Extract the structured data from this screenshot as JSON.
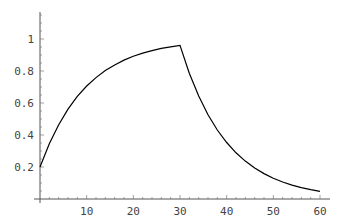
{
  "chart_data": {
    "type": "line",
    "title": "",
    "xlabel": "",
    "ylabel": "",
    "xlim": [
      0,
      61
    ],
    "ylim": [
      0,
      1.18
    ],
    "grid": false,
    "legend": null,
    "x_ticks": [
      10,
      20,
      30,
      40,
      50,
      60
    ],
    "y_ticks": [
      0.2,
      0.4,
      0.6,
      0.8,
      1
    ],
    "x_tick_labels": [
      "10",
      "20",
      "30",
      "40",
      "50",
      "60"
    ],
    "y_tick_labels": [
      "0.2",
      "0.4",
      "0.6",
      "0.8",
      "1"
    ],
    "series": [
      {
        "name": "response",
        "x": [
          0,
          2,
          4,
          6,
          8,
          10,
          12,
          14,
          16,
          18,
          20,
          22,
          24,
          26,
          28,
          30,
          32,
          34,
          36,
          38,
          40,
          42,
          44,
          46,
          48,
          50,
          52,
          54,
          56,
          58,
          60
        ],
        "y": [
          0.2,
          0.345,
          0.464,
          0.561,
          0.641,
          0.706,
          0.759,
          0.803,
          0.838,
          0.868,
          0.892,
          0.911,
          0.927,
          0.941,
          0.951,
          0.96,
          0.786,
          0.644,
          0.527,
          0.431,
          0.353,
          0.289,
          0.237,
          0.194,
          0.159,
          0.13,
          0.106,
          0.087,
          0.071,
          0.058,
          0.048
        ]
      }
    ],
    "color": "#000000"
  }
}
